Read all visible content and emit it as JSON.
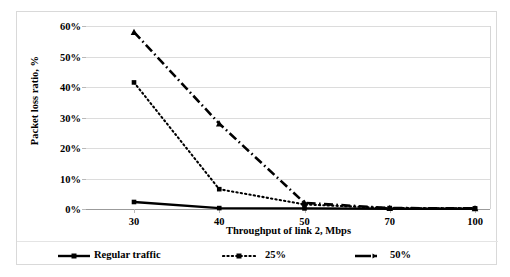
{
  "chart_data": {
    "type": "line",
    "title": "",
    "xlabel": "Throughput of link 2, Mbps",
    "ylabel": "Packet loss ratio, %",
    "categories": [
      "30",
      "40",
      "50",
      "70",
      "100"
    ],
    "x_tick_labels": [
      "30",
      "40",
      "50",
      "70",
      "100"
    ],
    "y_tick_labels": [
      "60%",
      "50%",
      "40%",
      "30%",
      "20%",
      "10%",
      "0%"
    ],
    "y_tick_values": [
      60,
      50,
      40,
      30,
      20,
      10,
      0
    ],
    "ylim": [
      0,
      60
    ],
    "grid": "horizontal",
    "legend_position": "bottom",
    "series": [
      {
        "name": "Regular traffic",
        "style": "solid",
        "marker": "square",
        "color": "#000000",
        "values": [
          2.3,
          0.3,
          0.2,
          0.1,
          0.1
        ]
      },
      {
        "name": "25%",
        "style": "dotted",
        "marker": "square",
        "color": "#000000",
        "values": [
          41.5,
          6.5,
          1.5,
          0.3,
          0.2
        ]
      },
      {
        "name": "50%",
        "style": "dash-dot",
        "marker": "triangle",
        "color": "#000000",
        "values": [
          58.0,
          28.0,
          2.0,
          0.3,
          0.2
        ]
      }
    ]
  },
  "legend": {
    "entries": [
      {
        "label": "Regular traffic",
        "swatch": "solid-line-square-marker"
      },
      {
        "label": "25%",
        "swatch": "dotted-line-square-marker"
      },
      {
        "label": "50%",
        "swatch": "dash-dot-line-arrow-marker"
      }
    ]
  },
  "axes": {
    "y_title": "Packet loss ratio, %",
    "x_title": "Throughput of link 2, Mbps"
  }
}
